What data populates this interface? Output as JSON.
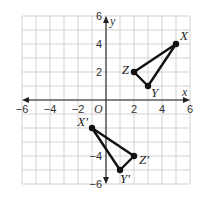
{
  "chart_data": {
    "type": "scatter",
    "title": "",
    "xlabel": "x",
    "ylabel": "y",
    "xlim": [
      -6,
      6
    ],
    "ylim": [
      -6,
      6
    ],
    "grid": true,
    "origin_label": "O",
    "x_ticks": [
      {
        "value": -6,
        "label": "−6"
      },
      {
        "value": -4,
        "label": "−4"
      },
      {
        "value": -2,
        "label": "−2"
      },
      {
        "value": 2,
        "label": "2"
      },
      {
        "value": 4,
        "label": "4"
      },
      {
        "value": 6,
        "label": "6"
      }
    ],
    "y_ticks": [
      {
        "value": 6,
        "label": "6"
      },
      {
        "value": 4,
        "label": "4"
      },
      {
        "value": 2,
        "label": "2"
      },
      {
        "value": -4,
        "label": "−4"
      },
      {
        "value": -6,
        "label": "−6"
      }
    ],
    "series": [
      {
        "name": "triangle XYZ",
        "points": [
          {
            "label": "X",
            "x": 5,
            "y": 4
          },
          {
            "label": "Y",
            "x": 3,
            "y": 1
          },
          {
            "label": "Z",
            "x": 2,
            "y": 2
          }
        ]
      },
      {
        "name": "triangle X'Y'Z'",
        "points": [
          {
            "label": "X′",
            "x": -1,
            "y": -2
          },
          {
            "label": "Y′",
            "x": 1,
            "y": -5
          },
          {
            "label": "Z′",
            "x": 2,
            "y": -4
          }
        ]
      }
    ]
  }
}
